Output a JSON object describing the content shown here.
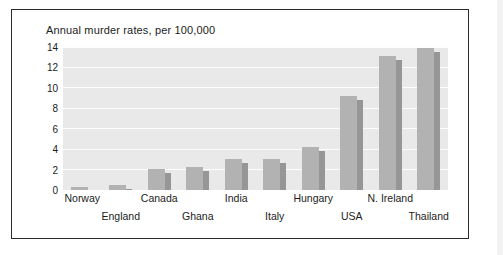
{
  "chart_data": {
    "type": "bar",
    "title": "Annual murder rates, per 100,000",
    "xlabel": "",
    "ylabel": "",
    "ylim": [
      0,
      14
    ],
    "yticks": [
      0,
      2,
      4,
      6,
      8,
      10,
      12,
      14
    ],
    "grid": true,
    "legend": "none",
    "categories": [
      "Norway",
      "England",
      "Canada",
      "Ghana",
      "India",
      "Italy",
      "Hungary",
      "USA",
      "N. Ireland",
      "Thailand"
    ],
    "values": [
      0.3,
      0.5,
      2.1,
      2.25,
      3.0,
      3.0,
      4.2,
      9.2,
      13.1,
      13.9
    ],
    "series": [
      {
        "name": "Annual murder rate per 100,000",
        "values": [
          0.3,
          0.5,
          2.1,
          2.25,
          3.0,
          3.0,
          4.2,
          9.2,
          13.1,
          13.9
        ]
      }
    ],
    "style": {
      "bar_face_color": "#b2b2b2",
      "bar_side_color": "#969696",
      "plot_background": "#e9e9e9",
      "gridline_color": "#fdfdfd",
      "text_color": "#1c1c1c",
      "frame_color": "#2b2b2b"
    },
    "label_layout": "staggered-two-rows"
  }
}
